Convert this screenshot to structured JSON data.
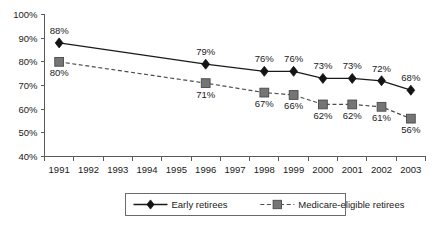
{
  "chart_data": {
    "type": "line",
    "title": "",
    "subtitle": "",
    "xlabel": "",
    "ylabel": "",
    "ylim": [
      40,
      100
    ],
    "ytick_labels": [
      "40%",
      "50%",
      "60%",
      "70%",
      "80%",
      "90%",
      "100%"
    ],
    "ytick_values": [
      40,
      50,
      60,
      70,
      80,
      90,
      100
    ],
    "categories": [
      "1991",
      "1992",
      "1993",
      "1994",
      "1995",
      "1996",
      "1997",
      "1998",
      "1999",
      "2000",
      "2001",
      "2002",
      "2003"
    ],
    "grid": false,
    "legend_position": "bottom",
    "series": [
      {
        "name": "Early retirees",
        "marker": "diamond",
        "line_style": "solid",
        "color": "#141414",
        "x": [
          "1991",
          "1996",
          "1998",
          "1999",
          "2000",
          "2001",
          "2002",
          "2003"
        ],
        "values": [
          88,
          79,
          76,
          76,
          73,
          73,
          72,
          68
        ],
        "data_labels": [
          "88%",
          "79%",
          "76%",
          "76%",
          "73%",
          "73%",
          "72%",
          "68%"
        ],
        "label_position": "above"
      },
      {
        "name": "Medicare-eligible retirees",
        "marker": "square",
        "line_style": "dashed",
        "color": "#757575",
        "x": [
          "1991",
          "1996",
          "1998",
          "1999",
          "2000",
          "2001",
          "2002",
          "2003"
        ],
        "values": [
          80,
          71,
          67,
          66,
          62,
          62,
          61,
          56
        ],
        "data_labels": [
          "80%",
          "71%",
          "67%",
          "66%",
          "62%",
          "62%",
          "61%",
          "56%"
        ],
        "label_position": "below"
      }
    ],
    "legend_entries": [
      {
        "label": "Early retirees",
        "marker": "diamond",
        "line_style": "solid",
        "color": "#141414"
      },
      {
        "label": "Medicare-eligible retirees",
        "marker": "square",
        "line_style": "dashed",
        "color": "#757575"
      }
    ]
  }
}
